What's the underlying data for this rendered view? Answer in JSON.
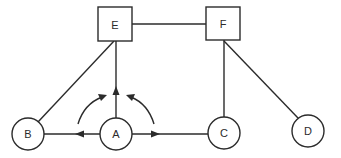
{
  "diagram": {
    "type": "node-link graph",
    "colors": {
      "stroke": "#2b2b2b",
      "background": "#ffffff"
    },
    "nodes": [
      {
        "id": "E",
        "label": "E",
        "shape": "square",
        "x": 115,
        "y": 24
      },
      {
        "id": "F",
        "label": "F",
        "shape": "square",
        "x": 223,
        "y": 24
      },
      {
        "id": "A",
        "label": "A",
        "shape": "circle",
        "x": 116,
        "y": 134
      },
      {
        "id": "B",
        "label": "B",
        "shape": "circle",
        "x": 28,
        "y": 134
      },
      {
        "id": "C",
        "label": "C",
        "shape": "circle",
        "x": 224,
        "y": 133
      },
      {
        "id": "D",
        "label": "D",
        "shape": "circle",
        "x": 308,
        "y": 131
      }
    ],
    "edges": [
      {
        "from": "E",
        "to": "F",
        "directed": false
      },
      {
        "from": "B",
        "to": "E",
        "directed": false
      },
      {
        "from": "A",
        "to": "E",
        "directed": true,
        "arrow_direction": "up"
      },
      {
        "from": "A",
        "to": "B",
        "directed": true,
        "arrow_direction": "left"
      },
      {
        "from": "A",
        "to": "C",
        "directed": true,
        "arrow_direction": "right"
      },
      {
        "from": "F",
        "to": "C",
        "directed": false
      },
      {
        "from": "F",
        "to": "D",
        "directed": false
      }
    ],
    "curved_arrows": [
      {
        "side": "left",
        "description": "curved arrow sweeping from B-direction toward E-direction"
      },
      {
        "side": "right",
        "description": "curved arrow sweeping from C-direction toward E-direction"
      }
    ]
  }
}
